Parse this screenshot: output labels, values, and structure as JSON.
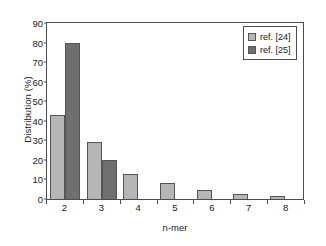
{
  "chart_data": {
    "type": "bar",
    "title": "",
    "xlabel": "n-mer",
    "ylabel": "Distribution (%)",
    "categories": [
      "2",
      "3",
      "4",
      "5",
      "6",
      "7",
      "8"
    ],
    "series": [
      {
        "name": "ref. [24]",
        "color": "#b6b6b6",
        "values": [
          43,
          29,
          13,
          8,
          4.5,
          2.5,
          1.5
        ]
      },
      {
        "name": "ref. [25]",
        "color": "#6f6f6f",
        "values": [
          80,
          20,
          null,
          null,
          null,
          null,
          null
        ]
      }
    ],
    "ylim": [
      0,
      90
    ],
    "ytick_values": [
      0,
      10,
      20,
      30,
      40,
      50,
      60,
      70,
      80,
      90
    ],
    "ytick_labels": [
      "0",
      "10",
      "20",
      "30",
      "40",
      "50",
      "60",
      "70",
      "80",
      "90"
    ],
    "grid": false,
    "legend_position": "top-right",
    "legend_entries": [
      "ref. [24]",
      "ref. [25]"
    ]
  }
}
